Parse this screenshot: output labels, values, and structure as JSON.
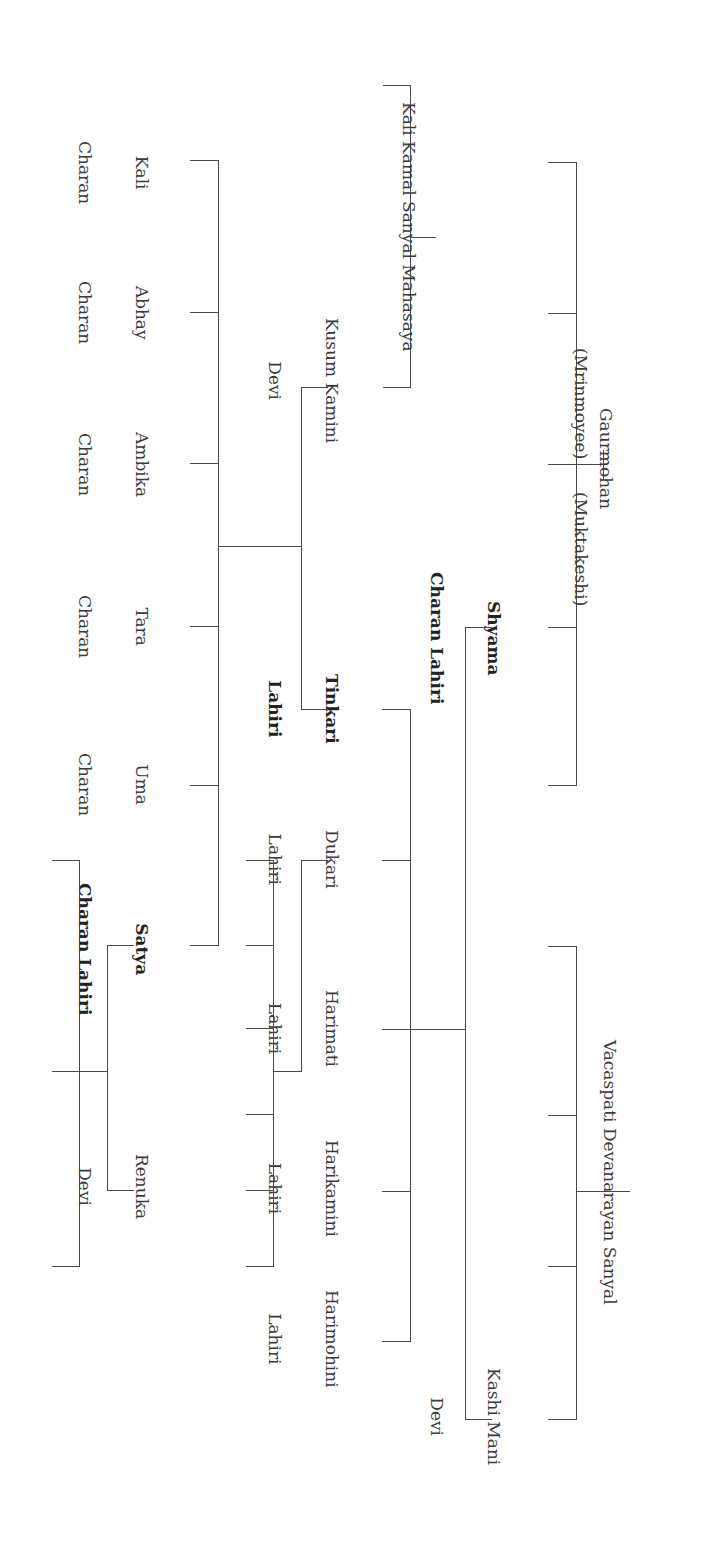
{
  "diagram": {
    "type": "family-tree",
    "orientation": "rotated-90-clockwise",
    "line_color": "#4a4a4a",
    "text_color": "#3a3a3a"
  },
  "people": {
    "gaurmohan": {
      "line1": "Gaurmohan",
      "line2": ""
    },
    "mrinmoyee": {
      "line1": "(Mrinmoyee)"
    },
    "muktakeshi": {
      "line1": "(Muktakeshi)"
    },
    "vacaspati": {
      "line1": "Vacaspati Devanarayan Sanyal"
    },
    "shyama": {
      "line1": "Shyama",
      "line2": "Charan Lahiri"
    },
    "kashi_mani": {
      "line1": "Kashi Mani",
      "line2": "Devi"
    },
    "kali_kamal": {
      "line1": "Kali Kamal Sanyal Mahasaya"
    },
    "kusum_kamini": {
      "line1": "Kusum Kamini",
      "line2": "Devi"
    },
    "tinkari": {
      "line1": "Tinkari",
      "line2": "Lahiri"
    },
    "dukari": {
      "line1": "Dukari",
      "line2": "Lahiri"
    },
    "harimati": {
      "line1": "Harimati",
      "line2": "Lahiri"
    },
    "harikamini": {
      "line1": "Harikamini",
      "line2": "Lahiri"
    },
    "harimohini": {
      "line1": "Harimohini",
      "line2": "Lahiri"
    },
    "kali_charan": {
      "line1": "Kali",
      "line2": "Charan"
    },
    "abhay_charan": {
      "line1": "Abhay",
      "line2": "Charan"
    },
    "ambika_charan": {
      "line1": "Ambika",
      "line2": "Charan"
    },
    "tara_charan": {
      "line1": "Tara",
      "line2": "Charan"
    },
    "uma_charan": {
      "line1": "Uma",
      "line2": "Charan"
    },
    "satya": {
      "line1": "Satya",
      "line2": "Charan Lahiri"
    },
    "renuka": {
      "line1": "Renuka",
      "line2": "Devi"
    }
  },
  "relationships": [
    {
      "parents": [
        "Gaurmohan",
        "Mrinmoyee",
        "Muktakeshi"
      ],
      "children_count": 5,
      "named_child": "Shyama Charan Lahiri"
    },
    {
      "parents": [
        "Vacaspati Devanarayan Sanyal"
      ],
      "children_count": 4,
      "named_child": "Kashi Mani Devi"
    },
    {
      "couple": [
        "Shyama Charan Lahiri",
        "Kashi Mani Devi"
      ],
      "children": [
        "Tinkari Lahiri",
        "Dukari Lahiri",
        "Harimati Lahiri",
        "Harikamini Lahiri",
        "Harimohini Lahiri"
      ]
    },
    {
      "parents": [
        "Kali Kamal Sanyal Mahasaya"
      ],
      "children_count": 3,
      "named_child": "Kusum Kamini Devi"
    },
    {
      "couple": [
        "Kusum Kamini Devi",
        "Tinkari Lahiri"
      ],
      "children": [
        "Kali Charan",
        "Abhay Charan",
        "Ambika Charan",
        "Tara Charan",
        "Uma Charan",
        "Satya Charan Lahiri"
      ]
    },
    {
      "parent": "Dukari Lahiri",
      "children_count": 6
    },
    {
      "couple": [
        "Satya Charan Lahiri",
        "Renuka Devi"
      ],
      "children_count": 3
    }
  ]
}
